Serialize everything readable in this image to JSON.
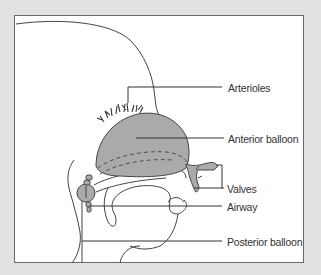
{
  "diagram": {
    "type": "anatomical-illustration",
    "labels": {
      "arterioles": "Arterioles",
      "anterior_balloon": "Anterior balloon",
      "valves": "Valves",
      "airway": "Airway",
      "posterior_balloon": "Posterior balloon"
    },
    "colors": {
      "background": "#e2e2e2",
      "panel": "#ffffff",
      "outline": "#444444",
      "balloon_fill": "#aaaaaa"
    }
  }
}
